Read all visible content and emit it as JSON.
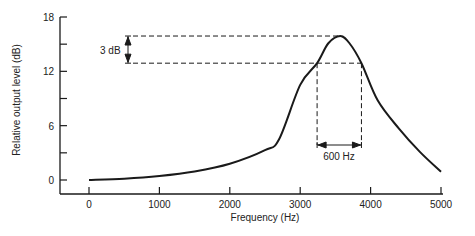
{
  "chart_data": {
    "type": "line",
    "title": "",
    "xlabel": "Frequency (Hz)",
    "ylabel": "Relative output level (dB)",
    "xlim": [
      0,
      5000
    ],
    "ylim": [
      0,
      18
    ],
    "x_ticks": [
      0,
      1000,
      2000,
      3000,
      4000,
      5000
    ],
    "y_ticks": [
      0,
      6,
      12,
      18
    ],
    "y_minor_ticks": [
      3,
      9,
      15
    ],
    "grid": false,
    "legend": null,
    "series": [
      {
        "name": "Frequency response",
        "x": [
          0,
          500,
          1000,
          1500,
          2000,
          2500,
          2700,
          3000,
          3240,
          3400,
          3570,
          3700,
          3870,
          4100,
          4400,
          4700,
          5000
        ],
        "y": [
          0.0,
          0.15,
          0.45,
          0.95,
          1.8,
          3.3,
          4.5,
          10.5,
          12.9,
          15.1,
          15.9,
          15.1,
          12.9,
          8.8,
          5.7,
          3.1,
          0.9
        ]
      }
    ],
    "annotations": [
      {
        "type": "vertical-double-arrow",
        "label": "3 dB",
        "y_from": 12.9,
        "y_to": 15.9
      },
      {
        "type": "horizontal-double-arrow",
        "label": "600 Hz",
        "x_from": 3240,
        "x_to": 3870
      },
      {
        "type": "dashed-hline",
        "y": 15.9
      },
      {
        "type": "dashed-hline",
        "y": 12.9
      },
      {
        "type": "dashed-vline",
        "x": 3240
      },
      {
        "type": "dashed-vline",
        "x": 3870
      }
    ]
  },
  "labels": {
    "xlabel": "Frequency (Hz)",
    "ylabel": "Relative output level (dB)",
    "x_ticks": [
      "0",
      "1000",
      "2000",
      "3000",
      "4000",
      "5000"
    ],
    "y_ticks": [
      "0",
      "6",
      "12",
      "18"
    ],
    "annot_db": "3 dB",
    "annot_hz": "600 Hz"
  },
  "colors": {
    "line": "#1a1a1a",
    "background": "#ffffff"
  }
}
